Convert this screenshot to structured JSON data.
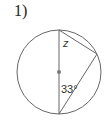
{
  "problem": {
    "number_label": "1)"
  },
  "diagram": {
    "unknown_angle_label": "z",
    "known_angle_label": "33°",
    "stroke_color": "#666666",
    "center_dot_color": "#777777"
  }
}
